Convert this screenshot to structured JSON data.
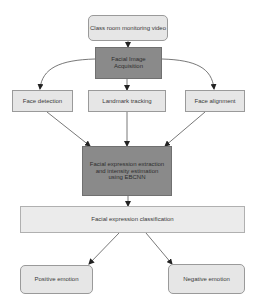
{
  "diagram": {
    "nodes": {
      "source": "Class room monitoring video",
      "acquisition": "Facial Image Acquisition",
      "face_detection": "Face detection",
      "landmark_tracking": "Landmark tracking",
      "face_alignment": "Face alignment",
      "extraction": "Facial expression extraction and intensity estimation using EBCNN",
      "classification": "Facial expression classification",
      "positive": "Positive emotion",
      "negative": "Negative emotion"
    },
    "edges": [
      {
        "from": "source",
        "to": "acquisition"
      },
      {
        "from": "acquisition",
        "to": "face_detection"
      },
      {
        "from": "acquisition",
        "to": "landmark_tracking"
      },
      {
        "from": "acquisition",
        "to": "face_alignment"
      },
      {
        "from": "face_detection",
        "to": "extraction"
      },
      {
        "from": "landmark_tracking",
        "to": "extraction"
      },
      {
        "from": "face_alignment",
        "to": "extraction"
      },
      {
        "from": "extraction",
        "to": "classification"
      },
      {
        "from": "classification",
        "to": "positive"
      },
      {
        "from": "classification",
        "to": "negative"
      }
    ],
    "colors": {
      "light_fill": "#e6e6e6",
      "dark_fill": "#8a8a8a",
      "edge": "#555555"
    }
  }
}
